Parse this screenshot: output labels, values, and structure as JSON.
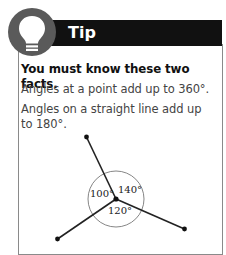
{
  "tip": {
    "title": "Tip",
    "icon": "lightbulb-icon",
    "heading": "You must know these two facts.",
    "facts": [
      "Angles at a point add up to 360°.",
      "Angles on a straight line add up to 180°."
    ],
    "diagram": {
      "angles": [
        {
          "label": "100°"
        },
        {
          "label": "140°"
        },
        {
          "label": "120°"
        }
      ]
    }
  },
  "colors": {
    "header_bg": "#111111",
    "badge_bg": "#5a5a5a",
    "border": "#8a8a8a"
  }
}
